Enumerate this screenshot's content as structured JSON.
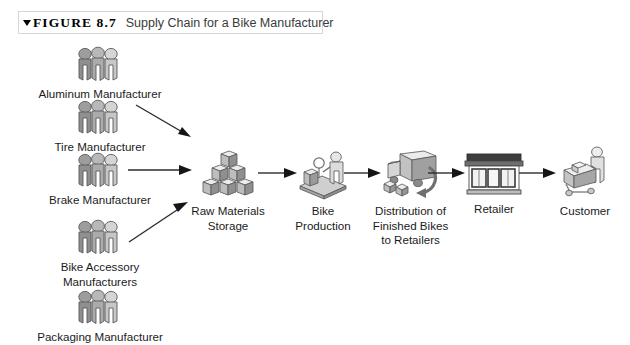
{
  "figure": {
    "marker_icon": "triangle-down-icon",
    "number": "FIGURE 8.7",
    "title": "Supply Chain for a Bike Manufacturer"
  },
  "diagram": {
    "type": "flow-diagram",
    "suppliers": [
      {
        "id": "aluminum",
        "label": "Aluminum Manufacturer",
        "icon": "three-people-icon"
      },
      {
        "id": "tire",
        "label": "Tire Manufacturer",
        "icon": "three-people-icon"
      },
      {
        "id": "brake",
        "label": "Brake Manufacturer",
        "icon": "three-people-icon"
      },
      {
        "id": "accessory",
        "label": "Bike Accessory\nManufacturers",
        "icon": "three-people-icon"
      },
      {
        "id": "packaging",
        "label": "Packaging Manufacturer",
        "icon": "three-people-icon"
      }
    ],
    "chain": [
      {
        "id": "storage",
        "label": "Raw Materials\nStorage",
        "icon": "stacked-boxes-icon"
      },
      {
        "id": "production",
        "label": "Bike\nProduction",
        "icon": "factory-worker-icon"
      },
      {
        "id": "distribution",
        "label": "Distribution of\nFinished Bikes\nto Retailers",
        "icon": "delivery-truck-icon"
      },
      {
        "id": "retailer",
        "label": "Retailer",
        "icon": "storefront-icon"
      },
      {
        "id": "customer",
        "label": "Customer",
        "icon": "shopping-cart-person-icon"
      }
    ],
    "connectors": [
      {
        "id": "tire-to-storage",
        "style": "diagonal-down"
      },
      {
        "id": "brake-to-storage",
        "style": "horizontal"
      },
      {
        "id": "accessory-to-storage",
        "style": "diagonal-up"
      },
      {
        "id": "storage-to-production",
        "style": "horizontal"
      },
      {
        "id": "production-to-distribution",
        "style": "horizontal"
      },
      {
        "id": "distribution-to-retailer",
        "style": "horizontal"
      },
      {
        "id": "retailer-to-customer",
        "style": "horizontal"
      }
    ]
  },
  "colors": {
    "background": "#ffffff",
    "text": "#1b1b1b",
    "caption_border": "#d6d6d6",
    "icon_light": "#e3e3e3",
    "icon_mid": "#b5b5b5",
    "icon_dark": "#7d7d7d",
    "icon_outline": "#4a4a4a",
    "arrow": "#2b2b2b"
  }
}
